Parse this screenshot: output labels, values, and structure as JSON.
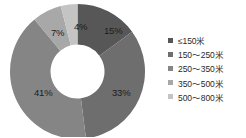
{
  "chart_data": {
    "type": "pie",
    "variant": "donut",
    "title": "",
    "subtitle": "",
    "xlabel": "",
    "ylabel": "",
    "grid": false,
    "legend_position": "right",
    "categories": [
      "≤150米",
      "150～250米",
      "250～350米",
      "350～500米",
      "500～800米"
    ],
    "values": [
      15,
      33,
      41,
      7,
      4
    ],
    "value_unit": "%",
    "data_labels": [
      "15%",
      "33%",
      "41%",
      "7%",
      "4%"
    ],
    "colors": [
      "#575757",
      "#6e6e6e",
      "#858585",
      "#a8a8a8",
      "#c4c4c4"
    ],
    "start_angle_deg": 0,
    "direction": "clockwise",
    "inner_radius_ratio": 0.4
  },
  "donut": {
    "slices": [
      {
        "label": "15%",
        "value": 15,
        "color": "#575757",
        "category": "≤150米",
        "label_x": 96,
        "label_y": 22
      },
      {
        "label": "33%",
        "value": 33,
        "color": "#6e6e6e",
        "category": "150～250米",
        "label_x": 104,
        "label_y": 84
      },
      {
        "label": "41%",
        "value": 41,
        "color": "#858585",
        "category": "250～350米",
        "label_x": 26,
        "label_y": 84
      },
      {
        "label": "7%",
        "value": 7,
        "color": "#a8a8a8",
        "category": "350～500米",
        "label_x": 43,
        "label_y": 24
      },
      {
        "label": "4%",
        "value": 4,
        "color": "#c4c4c4",
        "category": "500～800米",
        "label_x": 66,
        "label_y": 18
      }
    ]
  },
  "legend": {
    "items": [
      {
        "label": "≤150米",
        "color": "#575757"
      },
      {
        "label": "150～250米",
        "color": "#6e6e6e"
      },
      {
        "label": "250～350米",
        "color": "#858585"
      },
      {
        "label": "350～500米",
        "color": "#a8a8a8"
      },
      {
        "label": "500～800米",
        "color": "#c4c4c4"
      }
    ]
  }
}
